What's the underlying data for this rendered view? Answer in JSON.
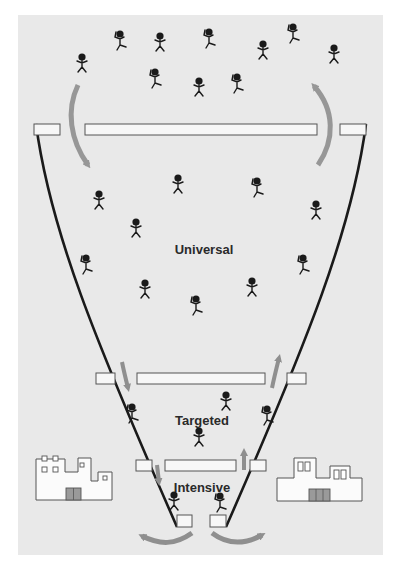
{
  "diagram": {
    "type": "tiered-funnel",
    "colors": {
      "background": "#e9e9e9",
      "funnel_line": "#1a1a1a",
      "bar_fill": "#f7f7f7",
      "bar_stroke": "#555555",
      "arrow": "#8f8f8f",
      "figure": "#1a1a1a",
      "building_fill": "#fbfbfb",
      "building_stroke": "#555555",
      "door_fill": "#9a9a9a"
    },
    "tiers": [
      {
        "id": "universal",
        "label": "Universal",
        "x": 204,
        "y": 240
      },
      {
        "id": "targeted",
        "label": "Targeted",
        "x": 202,
        "y": 411
      },
      {
        "id": "intensive",
        "label": "Intensive",
        "x": 202,
        "y": 478
      }
    ],
    "buildings": [
      {
        "id": "building-left",
        "side": "left"
      },
      {
        "id": "building-right",
        "side": "right"
      }
    ],
    "figures_outside": 11,
    "figures_universal": 11,
    "figures_targeted": 5,
    "figures_intensive": 2
  }
}
